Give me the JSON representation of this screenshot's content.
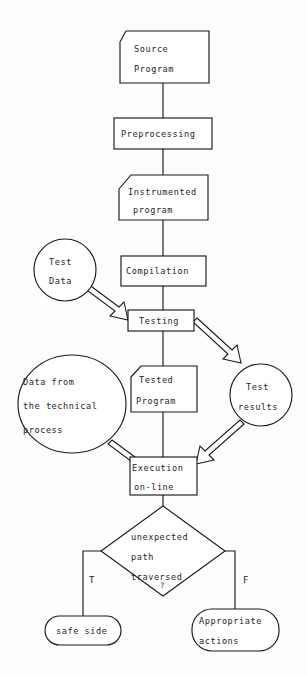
{
  "diagram": {
    "stroke_color": "#1a1a1a",
    "fill_color": "#ffffff",
    "text_color": "#262626",
    "nodes": {
      "source_program": {
        "line1": "Source",
        "line2": "Program",
        "shape": "document"
      },
      "preprocessing": {
        "line1": "Preprocessing",
        "shape": "rectangle"
      },
      "instrumented_program": {
        "line1": "Instrumented",
        "line2": "program",
        "shape": "document"
      },
      "compilation": {
        "line1": "Compilation",
        "shape": "rectangle"
      },
      "testing": {
        "line1": "Testing",
        "shape": "rectangle"
      },
      "test_data": {
        "line1": "Test",
        "line2": "Data",
        "shape": "circle"
      },
      "test_results": {
        "line1": "Test",
        "line2": "results",
        "shape": "circle"
      },
      "tested_program": {
        "line1": "Tested",
        "line2": "Program",
        "shape": "document"
      },
      "data_from_process": {
        "line1": "Data from",
        "line2": "the technical",
        "line3": "process",
        "shape": "circle"
      },
      "execution_online": {
        "line1": "Execution",
        "line2": "on-line",
        "shape": "rectangle"
      },
      "decision": {
        "line1": "unexpected",
        "line2": "path",
        "line3": "traversed",
        "line4": "?",
        "shape": "diamond"
      },
      "safe_side": {
        "line1": "safe side",
        "shape": "stadium"
      },
      "appropriate_actions": {
        "line1": "Appropriate",
        "line2": "actions",
        "shape": "stadium"
      }
    },
    "branch_labels": {
      "true_label": "T",
      "false_label": "F"
    }
  }
}
